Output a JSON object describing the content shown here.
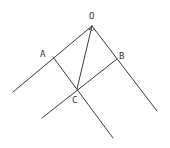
{
  "diagram": {
    "type": "geometry",
    "points": [
      {
        "id": "O",
        "label": "O",
        "x": 92,
        "y": 26,
        "label_x": 89,
        "label_y": 19
      },
      {
        "id": "A",
        "label": "A",
        "x": 53,
        "y": 57,
        "label_x": 40,
        "label_y": 57
      },
      {
        "id": "B",
        "label": "B",
        "x": 117,
        "y": 59,
        "label_x": 119,
        "label_y": 59
      },
      {
        "id": "C",
        "label": "C",
        "x": 77,
        "y": 89,
        "label_x": 72,
        "label_y": 103
      }
    ],
    "labels": {
      "O": "O",
      "A": "A",
      "B": "B",
      "C": "C"
    },
    "segments": [
      {
        "name": "ray-OA",
        "x1": 92,
        "y1": 26,
        "x2": 13,
        "y2": 92
      },
      {
        "name": "ray-OB",
        "x1": 92,
        "y1": 26,
        "x2": 157,
        "y2": 111
      },
      {
        "name": "line-AC",
        "x1": 53,
        "y1": 57,
        "x2": 113,
        "y2": 138
      },
      {
        "name": "line-BC",
        "x1": 117,
        "y1": 59,
        "x2": 42,
        "y2": 118
      },
      {
        "name": "segment-OC",
        "x1": 92,
        "y1": 26,
        "x2": 77,
        "y2": 89
      }
    ],
    "angle_marks_at": "O",
    "colors": {
      "line": "#3a3a3a",
      "background": "#ffffff"
    }
  }
}
